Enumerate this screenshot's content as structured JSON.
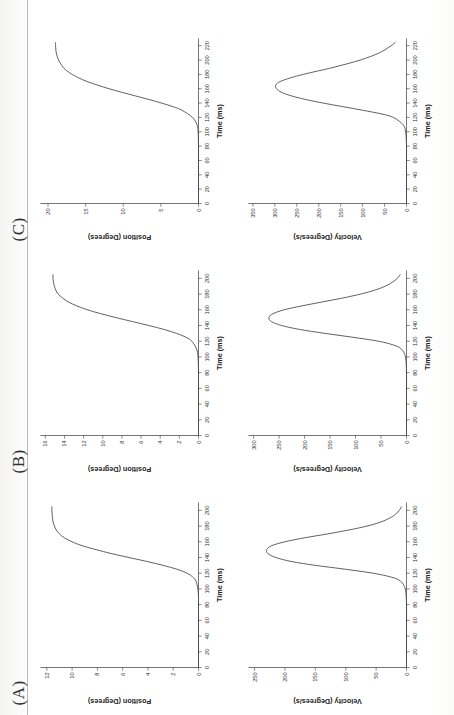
{
  "figure": {
    "panel_labels": [
      "(A)",
      "(B)",
      "(C)"
    ],
    "orientation": "page rotated 90 degrees counter-clockwise"
  },
  "chart_data": [
    {
      "type": "line",
      "panel": "(A)",
      "subplot": "position",
      "title": "",
      "xlabel": "Time (ms)",
      "ylabel": "Position (Degrees)",
      "xlim": [
        0,
        210
      ],
      "ylim": [
        0,
        12.5
      ],
      "xticks": [
        0,
        20,
        40,
        60,
        80,
        100,
        120,
        140,
        160,
        180,
        200
      ],
      "yticks": [
        0,
        2,
        4,
        6,
        8,
        10,
        12
      ],
      "grid": false,
      "legend": "none",
      "x": [
        0,
        10,
        20,
        30,
        40,
        50,
        60,
        70,
        80,
        90,
        100,
        110,
        115,
        120,
        125,
        130,
        135,
        140,
        145,
        150,
        155,
        160,
        165,
        170,
        175,
        180,
        185,
        190,
        195,
        200,
        205
      ],
      "y": [
        0,
        0,
        0,
        0,
        0,
        0,
        0,
        0,
        0,
        0,
        0.05,
        0.2,
        0.45,
        0.9,
        1.7,
        2.8,
        4.1,
        5.5,
        6.9,
        8.1,
        9.2,
        10.0,
        10.6,
        11.0,
        11.25,
        11.4,
        11.5,
        11.55,
        11.58,
        11.6,
        11.6
      ]
    },
    {
      "type": "line",
      "panel": "(A)",
      "subplot": "velocity",
      "title": "",
      "xlabel": "Time (ms)",
      "ylabel": "Velocity (Degrees/s)",
      "xlim": [
        0,
        210
      ],
      "ylim": [
        0,
        260
      ],
      "xticks": [
        0,
        20,
        40,
        60,
        80,
        100,
        120,
        140,
        160,
        180,
        200
      ],
      "yticks": [
        0,
        50,
        100,
        150,
        200,
        250
      ],
      "grid": false,
      "legend": "none",
      "x": [
        0,
        20,
        40,
        60,
        80,
        100,
        110,
        115,
        120,
        125,
        130,
        135,
        140,
        145,
        150,
        155,
        160,
        165,
        170,
        175,
        180,
        185,
        190,
        195,
        200,
        205
      ],
      "y": [
        0,
        0,
        0,
        0,
        0,
        2,
        10,
        25,
        55,
        100,
        150,
        190,
        215,
        228,
        230,
        222,
        200,
        168,
        130,
        95,
        65,
        43,
        28,
        18,
        12,
        8
      ]
    },
    {
      "type": "line",
      "panel": "(B)",
      "subplot": "position",
      "title": "",
      "xlabel": "Time (ms)",
      "ylabel": "Position (Degrees)",
      "xlim": [
        0,
        210
      ],
      "ylim": [
        0,
        16.5
      ],
      "xticks": [
        0,
        20,
        40,
        60,
        80,
        100,
        120,
        140,
        160,
        180,
        200
      ],
      "yticks": [
        0,
        2,
        4,
        6,
        8,
        10,
        12,
        14,
        16
      ],
      "grid": false,
      "legend": "none",
      "x": [
        0,
        20,
        40,
        60,
        80,
        100,
        110,
        120,
        125,
        130,
        135,
        140,
        145,
        150,
        155,
        160,
        165,
        170,
        175,
        180,
        185,
        190,
        195,
        200,
        205
      ],
      "y": [
        0,
        0,
        0,
        0,
        0,
        0.05,
        0.2,
        0.7,
        1.3,
        2.3,
        3.6,
        5.2,
        6.9,
        8.6,
        10.2,
        11.6,
        12.7,
        13.6,
        14.2,
        14.65,
        14.9,
        15.05,
        15.15,
        15.2,
        15.2
      ]
    },
    {
      "type": "line",
      "panel": "(B)",
      "subplot": "velocity",
      "title": "",
      "xlabel": "Time (ms)",
      "ylabel": "Velocity (Degrees/s)",
      "xlim": [
        0,
        210
      ],
      "ylim": [
        0,
        310
      ],
      "xticks": [
        0,
        20,
        40,
        60,
        80,
        100,
        120,
        140,
        160,
        180,
        200
      ],
      "yticks": [
        0,
        50,
        100,
        150,
        200,
        250,
        300
      ],
      "grid": false,
      "legend": "none",
      "x": [
        0,
        20,
        40,
        60,
        80,
        100,
        110,
        115,
        120,
        125,
        130,
        135,
        140,
        145,
        150,
        155,
        160,
        165,
        170,
        175,
        180,
        185,
        190,
        195,
        200,
        205
      ],
      "y": [
        0,
        0,
        0,
        0,
        0,
        2,
        10,
        25,
        55,
        105,
        160,
        210,
        245,
        265,
        270,
        262,
        240,
        205,
        165,
        125,
        90,
        62,
        42,
        28,
        18,
        12
      ]
    },
    {
      "type": "line",
      "panel": "(C)",
      "subplot": "position",
      "title": "",
      "xlabel": "Time (ms)",
      "ylabel": "Position (Degrees)",
      "xlim": [
        0,
        230
      ],
      "ylim": [
        0,
        21
      ],
      "xticks": [
        0,
        20,
        40,
        60,
        80,
        100,
        120,
        140,
        160,
        180,
        200,
        220
      ],
      "yticks": [
        0,
        5,
        10,
        15,
        20
      ],
      "grid": false,
      "legend": "none",
      "x": [
        0,
        20,
        40,
        60,
        80,
        100,
        110,
        120,
        130,
        135,
        140,
        145,
        150,
        155,
        160,
        165,
        170,
        175,
        180,
        185,
        190,
        200,
        210,
        220,
        225
      ],
      "y": [
        0,
        0,
        0,
        0,
        0,
        0.05,
        0.2,
        0.8,
        2.2,
        3.4,
        4.9,
        6.6,
        8.4,
        10.2,
        11.9,
        13.4,
        14.8,
        15.9,
        16.8,
        17.5,
        18.0,
        18.6,
        18.9,
        19.0,
        19.0
      ]
    },
    {
      "type": "line",
      "panel": "(C)",
      "subplot": "velocity",
      "title": "",
      "xlabel": "Time (ms)",
      "ylabel": "Velocity (Degrees/s)",
      "xlim": [
        0,
        230
      ],
      "ylim": [
        0,
        360
      ],
      "xticks": [
        0,
        20,
        40,
        60,
        80,
        100,
        120,
        140,
        160,
        180,
        200,
        220
      ],
      "yticks": [
        0,
        50,
        100,
        150,
        200,
        250,
        300,
        350
      ],
      "grid": false,
      "legend": "none",
      "x": [
        0,
        20,
        40,
        60,
        80,
        100,
        110,
        120,
        125,
        130,
        135,
        140,
        145,
        150,
        155,
        160,
        165,
        170,
        175,
        180,
        185,
        190,
        200,
        210,
        220,
        225
      ],
      "y": [
        0,
        0,
        0,
        0,
        0,
        2,
        8,
        30,
        58,
        100,
        145,
        190,
        230,
        262,
        285,
        296,
        298,
        288,
        265,
        235,
        200,
        165,
        105,
        62,
        35,
        25
      ]
    }
  ]
}
